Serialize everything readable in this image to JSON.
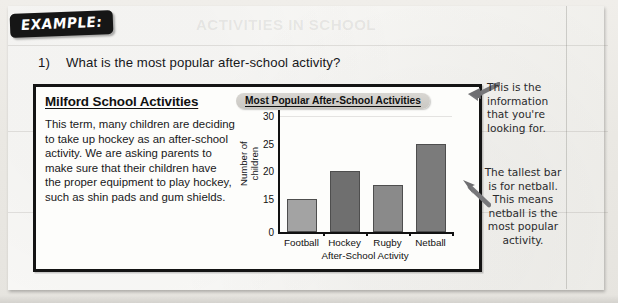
{
  "badge": {
    "label": "EXAMPLE:"
  },
  "question": {
    "number": "1)",
    "text": "What is the most popular after-school activity?"
  },
  "article": {
    "heading": "Milford School Activities",
    "body": "This term, many children are deciding to take up hockey as an after-school activity.  We are asking parents to make sure that their children have the proper equipment to play hockey, such as shin pads and gum shields."
  },
  "ghost_text": {
    "g1": "ACTIVITIES IN SCHOOL",
    "g2": "the school is doing well",
    "g3": "look at the chart",
    "g4": "reading information"
  },
  "annotations": [
    {
      "name": "info-note",
      "text": "This is the information that you're looking for."
    },
    {
      "name": "tallest-bar-note",
      "text": "The tallest bar is for netball. This means netball is the most popular activity."
    }
  ],
  "chart_data": {
    "type": "bar",
    "title": "Most Popular After-School Activities",
    "xlabel": "After-School Activity",
    "ylabel": "Number of children",
    "categories": [
      "Football",
      "Hockey",
      "Rugby",
      "Netball"
    ],
    "values": [
      15,
      20,
      17.5,
      25
    ],
    "bar_colors": [
      "#a3a3a3",
      "#6f6f6f",
      "#8a8a8a",
      "#7b7b7b"
    ],
    "ytick_labels": [
      "30",
      "25",
      "20",
      "15",
      "0"
    ],
    "ytick_values": [
      30,
      25,
      20,
      15,
      0
    ],
    "ylim": [
      0,
      30
    ],
    "axis_broken": true,
    "break_note": "axis jumps from 0 to 15",
    "grid": false,
    "legend": "none"
  }
}
